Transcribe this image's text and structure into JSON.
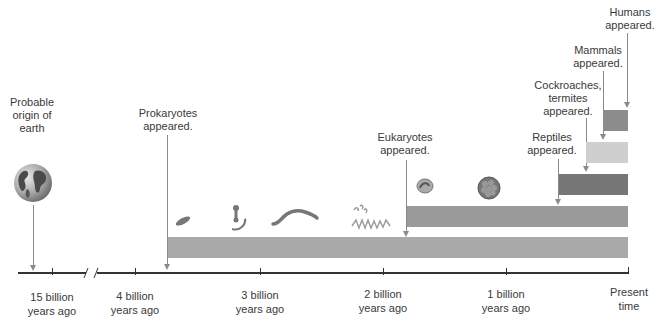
{
  "diagram": {
    "type": "timeline",
    "title": "",
    "axis": {
      "ticks": [
        {
          "line1": "15 billion",
          "line2": "years ago",
          "x": 52
        },
        {
          "line1": "4 billion",
          "line2": "years ago",
          "x": 135
        },
        {
          "line1": "3 billion",
          "line2": "years ago",
          "x": 260
        },
        {
          "line1": "2 billion",
          "line2": "years ago",
          "x": 383
        },
        {
          "line1": "1 billion",
          "line2": "years ago",
          "x": 506
        },
        {
          "line1": "Present",
          "line2": "time",
          "x": 628
        }
      ],
      "has_break": true
    },
    "events": [
      {
        "id": "earth",
        "lines": [
          "Probable",
          "origin of",
          "earth"
        ]
      },
      {
        "id": "prokaryotes",
        "lines": [
          "Prokaryotes",
          "appeared."
        ]
      },
      {
        "id": "eukaryotes",
        "lines": [
          "Eukaryotes",
          "appeared."
        ]
      },
      {
        "id": "reptiles",
        "lines": [
          "Reptiles",
          "appeared."
        ]
      },
      {
        "id": "cockroaches",
        "lines": [
          "Cockroaches,",
          "termites",
          "appeared."
        ]
      },
      {
        "id": "mammals",
        "lines": [
          "Mammals",
          "appeared."
        ]
      },
      {
        "id": "humans",
        "lines": [
          "Humans",
          "appeared."
        ]
      }
    ],
    "bars": [
      {
        "id": "prokaryotes",
        "color": "#a9a9a9"
      },
      {
        "id": "eukaryotes",
        "color": "#9a9a9a"
      },
      {
        "id": "reptiles",
        "color": "#777777"
      },
      {
        "id": "cockroaches",
        "color": "#cfcfcf"
      },
      {
        "id": "mammals",
        "color": "#8c8c8c"
      }
    ],
    "illustrations": [
      "earth-globe",
      "bacteria-rod",
      "bacteria-dumbbells",
      "bacteria-spiral",
      "filamentous-cells",
      "protist-cell",
      "colonial-algae-ball"
    ]
  }
}
